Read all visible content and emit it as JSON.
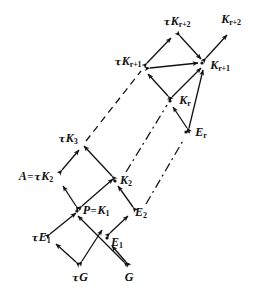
{
  "figure": {
    "background": "#ffffff",
    "ink": "#111111",
    "width": 258,
    "height": 295
  },
  "nodes": [
    {
      "id": "tauG",
      "label_html": "τG",
      "tau": "τ",
      "base": "G",
      "sub": "",
      "x": 79,
      "y": 276,
      "point_x": 79,
      "point_y": 266
    },
    {
      "id": "G",
      "label_html": "G",
      "tau": "",
      "base": "G",
      "sub": "",
      "x": 128,
      "y": 276,
      "point_x": 128,
      "point_y": 266
    },
    {
      "id": "tauE1",
      "label_html": "τE₁",
      "tau": "τ",
      "base": "E",
      "sub": "1",
      "x": 41,
      "y": 238,
      "point_x": 54,
      "point_y": 240
    },
    {
      "id": "E1",
      "label_html": "E₁",
      "tau": "",
      "base": "E",
      "sub": "1",
      "x": 116,
      "y": 240,
      "point_x": 104,
      "point_y": 237
    },
    {
      "id": "PK1",
      "label_html": "P=K₁",
      "tau": "",
      "base": "P=K",
      "sub": "1",
      "x": 93,
      "y": 211,
      "point_x": 75,
      "point_y": 211
    },
    {
      "id": "E2",
      "label_html": "E₂",
      "tau": "",
      "base": "E",
      "sub": "2",
      "x": 140,
      "y": 213,
      "point_x": 126,
      "point_y": 211
    },
    {
      "id": "AtauK2",
      "label_html": "A=τK₂",
      "tau": "τ",
      "base": "A=K",
      "sub": "2",
      "x": 38,
      "y": 177,
      "point_x": 66,
      "point_y": 180
    },
    {
      "id": "K2",
      "label_html": "K₂",
      "tau": "",
      "base": "K",
      "sub": "2",
      "x": 124,
      "y": 181,
      "point_x": 110,
      "point_y": 181
    },
    {
      "id": "tauK3",
      "label_html": "τK₃",
      "tau": "τ",
      "base": "K",
      "sub": "3",
      "x": 68,
      "y": 139,
      "point_x": 81,
      "point_y": 147
    },
    {
      "id": "Er",
      "label_html": "Eᵣ",
      "tau": "",
      "base": "E",
      "sub": "r",
      "x": 201,
      "y": 133,
      "point_x": 186,
      "point_y": 133
    },
    {
      "id": "Kr",
      "label_html": "Kᵣ",
      "tau": "",
      "base": "K",
      "sub": "r",
      "x": 186,
      "y": 101,
      "point_x": 170,
      "point_y": 101
    },
    {
      "id": "tauKr1",
      "label_html": "τKᵣ₊₁",
      "tau": "τ",
      "base": "K",
      "sub": "r+1",
      "x": 128,
      "y": 62,
      "point_x": 144,
      "point_y": 68
    },
    {
      "id": "Kr1",
      "label_html": "Kᵣ₊₁",
      "tau": "",
      "base": "K",
      "sub": "r+1",
      "x": 219,
      "y": 65,
      "point_x": 200,
      "point_y": 63
    },
    {
      "id": "tauKr2",
      "label_html": "τKᵣ₊₂",
      "tau": "τ",
      "base": "K",
      "sub": "r+2",
      "x": 177,
      "y": 22,
      "point_x": 177,
      "point_y": 33
    },
    {
      "id": "Kr2",
      "label_html": "Kᵣ₊₂",
      "tau": "",
      "base": "K",
      "sub": "r+2",
      "x": 231,
      "y": 20,
      "point_x": 228,
      "point_y": 31
    }
  ],
  "labels": {
    "tauG": {
      "tau": "τ",
      "base": "G",
      "eq": "",
      "sub": ""
    },
    "G": {
      "tau": "",
      "base": "G",
      "eq": "",
      "sub": ""
    },
    "tauE1": {
      "tau": "τ",
      "base": "E",
      "eq": "",
      "sub": "1"
    },
    "E1": {
      "tau": "",
      "base": "E",
      "eq": "",
      "sub": "1"
    },
    "PK1": {
      "tau": "",
      "base": "P",
      "eq": "=",
      "base2": "K",
      "sub": "1"
    },
    "E2": {
      "tau": "",
      "base": "E",
      "eq": "",
      "sub": "2"
    },
    "AtauK2": {
      "tau": "τ",
      "base": "A",
      "eq": "=",
      "base2": "K",
      "sub": "2"
    },
    "K2": {
      "tau": "",
      "base": "K",
      "eq": "",
      "sub": "2"
    },
    "tauK3": {
      "tau": "τ",
      "base": "K",
      "eq": "",
      "sub": "3"
    },
    "Er": {
      "tau": "",
      "base": "E",
      "eq": "",
      "sub": "r"
    },
    "Kr": {
      "tau": "",
      "base": "K",
      "eq": "",
      "sub": "r"
    },
    "tauKr1": {
      "tau": "τ",
      "base": "K",
      "eq": "",
      "sub": "r+1"
    },
    "Kr1": {
      "tau": "",
      "base": "K",
      "eq": "",
      "sub": "r+1"
    },
    "tauKr2": {
      "tau": "τ",
      "base": "K",
      "eq": "",
      "sub": "r+2"
    },
    "Kr2": {
      "tau": "",
      "base": "K",
      "eq": "",
      "sub": "r+2"
    }
  },
  "edges": [
    {
      "id": "e-tauG-tauE1",
      "from": "tauG",
      "to": "tauE1",
      "style": "solid",
      "arrow": "both"
    },
    {
      "id": "e-tauG-PK1",
      "from": "tauG",
      "to": "PK1",
      "style": "solid",
      "arrow": "both"
    },
    {
      "id": "e-G-E1",
      "from": "G",
      "to": "E1",
      "style": "solid",
      "arrow": "both"
    },
    {
      "id": "e-G-PK1",
      "from": "G",
      "to": "PK1",
      "style": "solid",
      "arrow": "both"
    },
    {
      "id": "e-tauE1-PK1",
      "from": "tauE1",
      "to": "PK1",
      "style": "solid",
      "arrow": "both"
    },
    {
      "id": "e-E1-E2",
      "from": "E1",
      "to": "E2",
      "style": "solid",
      "arrow": "both"
    },
    {
      "id": "e-PK1-AtauK2",
      "from": "PK1",
      "to": "AtauK2",
      "style": "solid",
      "arrow": "both"
    },
    {
      "id": "e-PK1-K2",
      "from": "PK1",
      "to": "K2",
      "style": "solid",
      "arrow": "both"
    },
    {
      "id": "e-E2-K2",
      "from": "E2",
      "to": "K2",
      "style": "solid",
      "arrow": "both"
    },
    {
      "id": "e-AtauK2-tauK3",
      "from": "AtauK2",
      "to": "tauK3",
      "style": "solid",
      "arrow": "both"
    },
    {
      "id": "e-K2-tauK3",
      "from": "K2",
      "to": "tauK3",
      "style": "solid",
      "arrow": "both"
    },
    {
      "id": "e-Er-Kr",
      "from": "Er",
      "to": "Kr",
      "style": "solid",
      "arrow": "both"
    },
    {
      "id": "e-Kr-tauKr1",
      "from": "Kr",
      "to": "tauKr1",
      "style": "solid",
      "arrow": "both"
    },
    {
      "id": "e-Kr-Kr1",
      "from": "Kr",
      "to": "Kr1",
      "style": "solid",
      "arrow": "both"
    },
    {
      "id": "e-Er-Kr1",
      "from": "Er",
      "to": "Kr1",
      "style": "solid",
      "arrow": "both"
    },
    {
      "id": "e-tauKr1-tauKr2",
      "from": "tauKr1",
      "to": "tauKr2",
      "style": "solid",
      "arrow": "both"
    },
    {
      "id": "e-tauKr1-Kr1",
      "from": "tauKr1",
      "to": "Kr1",
      "style": "solid",
      "arrow": "both"
    },
    {
      "id": "e-tauKr2-Kr1",
      "from": "tauKr2",
      "to": "Kr1",
      "style": "solid",
      "arrow": "both"
    },
    {
      "id": "e-Kr1-Kr2",
      "from": "Kr1",
      "to": "Kr2",
      "style": "solid",
      "arrow": "both"
    },
    {
      "id": "e-dash-tauK3-tauKr1",
      "from": "tauK3",
      "to": "tauKr1",
      "style": "dashed",
      "arrow": "none"
    },
    {
      "id": "e-dash-K2-Kr",
      "from": "K2",
      "to": "Kr",
      "style": "dashdot",
      "arrow": "none"
    },
    {
      "id": "e-dash-E2-Er",
      "from": "E2",
      "to": "Er",
      "style": "dashdot",
      "arrow": "none"
    }
  ],
  "legend": {
    "note": "Arrows are double-headed; dashed segments indicate omitted repeated stages."
  }
}
